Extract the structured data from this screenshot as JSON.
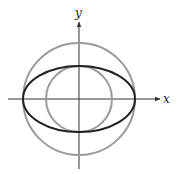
{
  "diagram": {
    "axes": {
      "x_label": "x",
      "y_label": "y"
    },
    "center": [
      79,
      99
    ],
    "outer_circle": {
      "radius": 56,
      "color": "#9a9a9a"
    },
    "inner_circle": {
      "radius": 33,
      "color": "#9a9a9a"
    },
    "ellipse": {
      "rx": 56,
      "ry": 33,
      "color": "#222222"
    },
    "axis_color": "#333333"
  }
}
